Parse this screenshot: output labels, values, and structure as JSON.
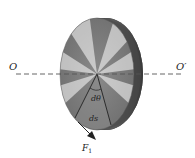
{
  "diagram": {
    "labels": {
      "axis_left": "O",
      "axis_right": "O′",
      "angle": "dθ",
      "arc": "ds",
      "force": "F",
      "force_sub": "1"
    },
    "colors": {
      "axis_dash": "#555555",
      "outline": "#333333",
      "rim_dark": "#3a3a3a",
      "face_mid": "#9a9a9a"
    }
  }
}
